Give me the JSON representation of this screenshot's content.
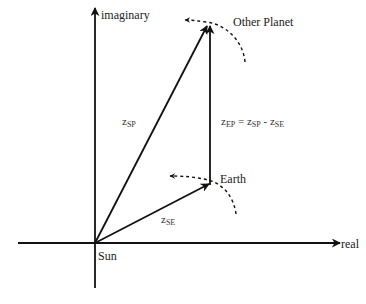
{
  "diagram": {
    "type": "complex-plane-vector-diagram",
    "axes": {
      "x_label": "real",
      "y_label": "imaginary",
      "origin_label": "Sun"
    },
    "points": {
      "earth": {
        "label": "Earth"
      },
      "other_planet": {
        "label": "Other Planet"
      }
    },
    "vectors": {
      "sun_to_planet": {
        "label_main": "z",
        "label_sub": "SP"
      },
      "sun_to_earth": {
        "label_main": "z",
        "label_sub": "SE"
      },
      "earth_to_planet": {
        "lhs_main": "z",
        "lhs_sub": "EP",
        "eq": " = ",
        "t1_main": "z",
        "t1_sub": "SP",
        "minus": " - ",
        "t2_main": "z",
        "t2_sub": "SE"
      }
    },
    "colors": {
      "stroke": "#111111",
      "text": "#222222"
    }
  }
}
